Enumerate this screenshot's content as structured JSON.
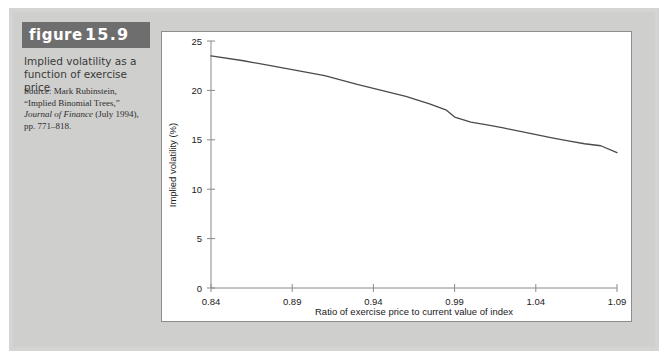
{
  "figure": {
    "label_word": "figure",
    "number": "15.9",
    "title": "Implied volatility as a function of exercise price",
    "source_lines": [
      "Source: Mark Rubinstein,",
      "“Implied Binomial Trees,”",
      "Journal of Finance (July 1994),",
      "pp. 771–818."
    ],
    "source_italic_line": "Journal of Finance"
  },
  "colors": {
    "page_background": "#d4d4d2",
    "panel_background": "#ffffff",
    "badge_background": "#6e6e6e",
    "badge_text": "#ffffff",
    "line": "#4a4a4a",
    "axis": "#8a8a8a"
  },
  "chart_data": {
    "type": "line",
    "title": "",
    "xlabel": "Ratio of exercise price to current value of index",
    "ylabel": "Implied volatility (%)",
    "xlim": [
      0.84,
      1.09
    ],
    "ylim": [
      0,
      25
    ],
    "xticks": [
      0.84,
      0.89,
      0.94,
      0.99,
      1.04,
      1.09
    ],
    "xtick_labels": [
      "0.84",
      "0.89",
      "0.94",
      "0.99",
      "1.04",
      "1.09"
    ],
    "yticks": [
      0,
      5,
      10,
      15,
      20,
      25
    ],
    "ytick_labels": [
      "0",
      "5",
      "10",
      "15",
      "20",
      "25"
    ],
    "grid": false,
    "legend": "none",
    "series": [
      {
        "name": "Implied volatility",
        "x": [
          0.84,
          0.86,
          0.88,
          0.89,
          0.91,
          0.93,
          0.94,
          0.96,
          0.975,
          0.985,
          0.99,
          1.0,
          1.01,
          1.02,
          1.035,
          1.05,
          1.06,
          1.07,
          1.08,
          1.09
        ],
        "values": [
          23.5,
          23.0,
          22.4,
          22.1,
          21.5,
          20.6,
          20.2,
          19.4,
          18.6,
          18.0,
          17.3,
          16.8,
          16.5,
          16.2,
          15.7,
          15.2,
          14.9,
          14.6,
          14.4,
          13.7
        ]
      }
    ]
  }
}
